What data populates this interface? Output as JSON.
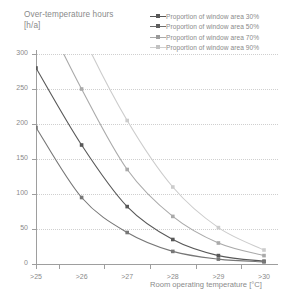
{
  "title": {
    "line1": "Over-temperature hours",
    "line2": "[h/a]"
  },
  "legend": {
    "items": [
      {
        "label": "Proportion of window area 30%",
        "color": "#585858",
        "marker": "square"
      },
      {
        "label": "Proportion of window area 50%",
        "color": "#777777",
        "marker": "square"
      },
      {
        "label": "Proportion of window area 70%",
        "color": "#aaaaaa",
        "marker": "square"
      },
      {
        "label": "Proportion of window area 90%",
        "color": "#cccccc",
        "marker": "square"
      }
    ]
  },
  "axes": {
    "y_label": "[h/a]",
    "x_caption": "Room operating temperature [°C]",
    "y_ticks": [
      "0",
      "50",
      "100",
      "150",
      "200",
      "250",
      "300"
    ],
    "x_ticks": [
      ">25",
      ">26",
      ">27",
      ">28",
      ">29",
      ">30"
    ]
  },
  "chart_data": {
    "type": "line",
    "title": "Over-temperature hours [h/a]",
    "xlabel": "Room operating temperature [°C]",
    "ylabel": "Over-temperature hours [h/a]",
    "categories": [
      ">25",
      ">26",
      ">27",
      ">28",
      ">29",
      ">30"
    ],
    "ylim": [
      0,
      300
    ],
    "ytick_step": 50,
    "grid": "horizontal-dotted",
    "legend_position": "top-right",
    "series": [
      {
        "name": "Proportion of window area 30%",
        "color": "#585858",
        "values": [
          280,
          170,
          82,
          35,
          12,
          4
        ]
      },
      {
        "name": "Proportion of window area 50%",
        "color": "#777777",
        "values": [
          195,
          95,
          45,
          18,
          7,
          3
        ]
      },
      {
        "name": "Proportion of window area 70%",
        "color": "#aaaaaa",
        "values": [
          380,
          250,
          135,
          68,
          30,
          12
        ]
      },
      {
        "name": "Proportion of window area 90%",
        "color": "#cccccc",
        "values": [
          480,
          330,
          205,
          110,
          52,
          20
        ]
      }
    ]
  },
  "colors": {
    "axis": "#9e9e9e",
    "grid": "#cfcfcf",
    "text": "#8a8a8a",
    "background": "#ffffff"
  }
}
